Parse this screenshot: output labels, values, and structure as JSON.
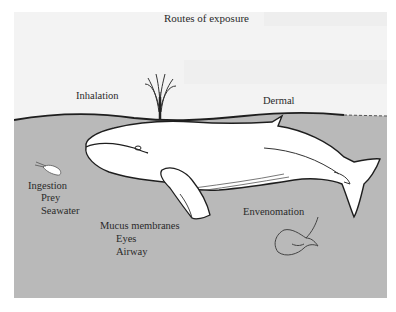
{
  "figure": {
    "title": "Routes of exposure",
    "colors": {
      "sky": "#f3f3f3",
      "water": "#b9b9b9",
      "whale_fill": "#ffffff",
      "outline": "#222222",
      "text": "#2a2a2a"
    },
    "routes": {
      "inhalation": "Inhalation",
      "dermal": "Dermal",
      "ingestion": {
        "heading": "Ingestion",
        "items": [
          "Prey",
          "Seawater"
        ]
      },
      "mucus": {
        "heading": "Mucus membranes",
        "items": [
          "Eyes",
          "Airway"
        ]
      },
      "envenomation": "Envenomation"
    },
    "icons": [
      "whale",
      "blowhole-spout",
      "krill-prey",
      "stingray-venomous"
    ]
  }
}
